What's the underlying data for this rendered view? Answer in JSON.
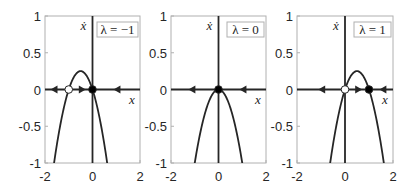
{
  "chart_data": [
    {
      "type": "line",
      "title": "",
      "legend": "λ = −1",
      "lambda": -1,
      "xlabel": "x",
      "ylabel": "ẋ",
      "xlim": [
        -2,
        2
      ],
      "ylim": [
        -1,
        1
      ],
      "xticks": [
        "-2",
        "0",
        "2"
      ],
      "yticks": [
        "-1",
        "-0.5",
        "0",
        "0.5",
        "1"
      ],
      "grid": false,
      "legend_position": "top-right",
      "function": "ẋ = λx − x²",
      "series": [
        {
          "name": "ẋ",
          "x": [
            -1.7,
            -1.5,
            -1.25,
            -1,
            -0.75,
            -0.5,
            -0.25,
            0,
            0.25,
            0.5,
            0.62
          ],
          "y": [
            -1.19,
            -0.75,
            -0.31,
            0,
            0.19,
            0.25,
            0.19,
            0,
            -0.31,
            -0.75,
            -1.0
          ]
        }
      ],
      "fixed_points": [
        {
          "x": -1,
          "stable": false
        },
        {
          "x": 0,
          "stable": true
        }
      ],
      "flow_arrows": [
        {
          "x": -1.6,
          "dir": "left"
        },
        {
          "x": -0.45,
          "dir": "right"
        },
        {
          "x": 1.05,
          "dir": "left"
        }
      ]
    },
    {
      "type": "line",
      "title": "",
      "legend": "λ = 0",
      "lambda": 0,
      "xlabel": "x",
      "ylabel": "ẋ",
      "xlim": [
        -2,
        2
      ],
      "ylim": [
        -1,
        1
      ],
      "xticks": [
        "-2",
        "0",
        "2"
      ],
      "yticks": [
        "-1",
        "-0.5",
        "0",
        "0.5",
        "1"
      ],
      "grid": false,
      "legend_position": "top-right",
      "function": "ẋ = λx − x²",
      "series": [
        {
          "name": "ẋ",
          "x": [
            -1,
            -0.75,
            -0.5,
            -0.25,
            0,
            0.25,
            0.5,
            0.75,
            1
          ],
          "y": [
            -1,
            -0.56,
            -0.25,
            -0.06,
            0,
            -0.06,
            -0.25,
            -0.56,
            -1
          ]
        }
      ],
      "fixed_points": [
        {
          "x": 0,
          "stable": "semi"
        }
      ],
      "flow_arrows": [
        {
          "x": -1.1,
          "dir": "left"
        },
        {
          "x": 1.05,
          "dir": "left"
        }
      ]
    },
    {
      "type": "line",
      "title": "",
      "legend": "λ = 1",
      "lambda": 1,
      "xlabel": "x",
      "ylabel": "ẋ",
      "xlim": [
        -2,
        2
      ],
      "ylim": [
        -1,
        1
      ],
      "xticks": [
        "-2",
        "0",
        "2"
      ],
      "yticks": [
        "-1",
        "-0.5",
        "0",
        "0.5",
        "1"
      ],
      "grid": false,
      "legend_position": "top-right",
      "function": "ẋ = λx − x²",
      "series": [
        {
          "name": "ẋ",
          "x": [
            -0.62,
            -0.5,
            -0.25,
            0,
            0.25,
            0.5,
            0.75,
            1,
            1.25,
            1.5,
            1.62
          ],
          "y": [
            -1.0,
            -0.75,
            -0.31,
            0,
            0.19,
            0.25,
            0.19,
            0,
            -0.31,
            -0.75,
            -1.0
          ]
        }
      ],
      "fixed_points": [
        {
          "x": 0,
          "stable": false
        },
        {
          "x": 1,
          "stable": true
        }
      ],
      "flow_arrows": [
        {
          "x": -0.95,
          "dir": "left"
        },
        {
          "x": 0.55,
          "dir": "right"
        },
        {
          "x": 1.6,
          "dir": "left"
        }
      ]
    }
  ],
  "panels": [
    {
      "legend": "λ = −1",
      "xlabel": "x",
      "ylabel": "ẋ"
    },
    {
      "legend": "λ = 0",
      "xlabel": "x",
      "ylabel": "ẋ"
    },
    {
      "legend": "λ = 1",
      "xlabel": "x",
      "ylabel": "ẋ"
    }
  ],
  "colors": {
    "axes": "#262626",
    "box": "#b0b0b0",
    "curve": "#262626",
    "stable": "#000000",
    "unstable": "#ffffff"
  }
}
